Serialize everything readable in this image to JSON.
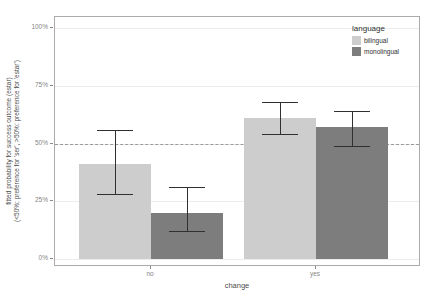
{
  "chart_data": {
    "type": "bar",
    "title": "",
    "xlabel": "change",
    "ylabel_line1": "fitted probability for success outcome (estar)",
    "ylabel_line2": "(<50%: preference for 'ser', >50%: preference for 'estar')",
    "categories": [
      "no",
      "yes"
    ],
    "series": [
      {
        "name": "bilingual",
        "color": "#cdcdcd",
        "values": [
          41,
          61
        ],
        "ci_low": [
          28,
          54
        ],
        "ci_high": [
          56,
          68
        ]
      },
      {
        "name": "monolingual",
        "color": "#7d7d7d",
        "values": [
          20,
          57
        ],
        "ci_low": [
          12,
          49
        ],
        "ci_high": [
          31,
          64
        ]
      }
    ],
    "y_ticks": [
      {
        "label": "0%",
        "value": 0
      },
      {
        "label": "25%",
        "value": 25
      },
      {
        "label": "50%",
        "value": 50
      },
      {
        "label": "75%",
        "value": 75
      },
      {
        "label": "100%",
        "value": 100
      }
    ],
    "ylim": [
      0,
      100
    ],
    "reference_line": 50,
    "grid": true,
    "legend_title": "language",
    "legend_position": "top-right-inside",
    "errorbar_color": "#303030",
    "panel_border_color": "#ababab"
  }
}
